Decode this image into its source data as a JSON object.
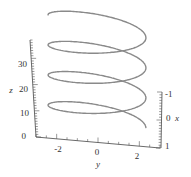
{
  "chart_data": {
    "type": "line",
    "subtype": "3d-parametric-curve",
    "title": "",
    "parametric": {
      "x": "cos(t)",
      "y": "3*sin(t)",
      "z": "t",
      "t_range": [
        0,
        37
      ],
      "turns": 3.5
    },
    "axes": {
      "z": {
        "label": "z",
        "ticks": [
          "0",
          "10",
          "20",
          "30"
        ],
        "range": [
          0,
          37
        ]
      },
      "y": {
        "label": "y",
        "ticks": [
          "-2",
          "0",
          "2"
        ],
        "range": [
          -3,
          3
        ]
      },
      "x": {
        "label": "x",
        "ticks": [
          "-1",
          "0",
          "1"
        ],
        "range": [
          -1,
          1
        ]
      }
    },
    "curve_color": "#8a8a8a",
    "grid": false,
    "legend": "none"
  }
}
